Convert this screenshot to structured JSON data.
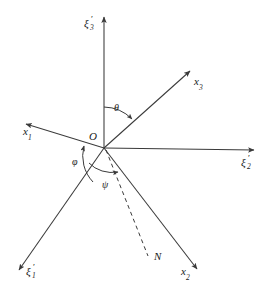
{
  "figure": {
    "type": "euler-angles-diagram",
    "background_color": "#ffffff",
    "line_color": "#3a3a3a",
    "text_color": "#1a1a1a",
    "width": 273,
    "height": 296
  },
  "origin": {
    "label": "O",
    "x": 104,
    "y": 148
  },
  "axes": [
    {
      "name": "xi-3-prime",
      "symbol": "ξ",
      "subscript": "3",
      "prime": "′",
      "label": "ξ′₃",
      "style": "solid",
      "tip_x": 104,
      "tip_y": 14,
      "label_x": 86,
      "label_y": 20
    },
    {
      "name": "xi-2-prime",
      "symbol": "ξ",
      "subscript": "2",
      "prime": "′",
      "label": "ξ′₂",
      "style": "solid",
      "tip_x": 258,
      "tip_y": 150,
      "label_x": 243,
      "label_y": 158
    },
    {
      "name": "xi-1-prime",
      "symbol": "ξ",
      "subscript": "1",
      "prime": "′",
      "label": "ξ′₁",
      "style": "solid",
      "tip_x": 15,
      "tip_y": 273,
      "label_x": 27,
      "label_y": 268
    },
    {
      "name": "x-1",
      "symbol": "x",
      "subscript": "1",
      "prime": "",
      "label": "x₁",
      "style": "solid",
      "tip_x": 22,
      "tip_y": 122,
      "label_x": 24,
      "label_y": 128
    },
    {
      "name": "x-2",
      "symbol": "x",
      "subscript": "2",
      "prime": "",
      "label": "x₂",
      "style": "solid",
      "tip_x": 201,
      "tip_y": 272,
      "label_x": 183,
      "label_y": 268
    },
    {
      "name": "x-3",
      "symbol": "x",
      "subscript": "3",
      "prime": "",
      "label": "x₃",
      "style": "solid",
      "tip_x": 193,
      "tip_y": 68,
      "label_x": 196,
      "label_y": 76
    }
  ],
  "node_line": {
    "name": "line-of-nodes",
    "label": "N",
    "style": "dashed",
    "end_x": 148,
    "end_y": 257,
    "label_x": 155,
    "label_y": 253
  },
  "angles": [
    {
      "name": "theta",
      "label": "θ",
      "label_x": 115,
      "label_y": 105,
      "between": [
        "xi-3-prime",
        "x-3"
      ]
    },
    {
      "name": "phi",
      "label": "φ",
      "label_x": 74,
      "label_y": 158,
      "between": [
        "xi-1-prime",
        "x-1"
      ]
    },
    {
      "name": "psi",
      "label": "ψ",
      "label_x": 104,
      "label_y": 181,
      "between": [
        "line-of-nodes",
        "x-1"
      ]
    }
  ]
}
